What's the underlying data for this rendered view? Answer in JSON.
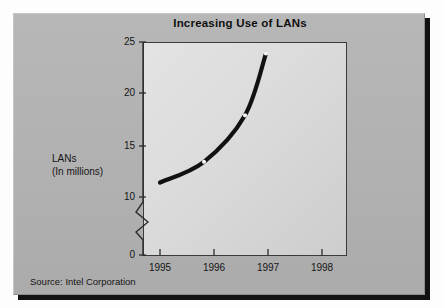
{
  "chart_data": {
    "type": "line",
    "title": "Increasing Use of LANs",
    "xlabel": "",
    "ylabel": "LANs (In millions)",
    "ylabel_line1": "LANs",
    "ylabel_line2": "(In millions)",
    "categories": [
      "1995",
      "1996",
      "1997",
      "1998"
    ],
    "values": [
      11.5,
      13.5,
      18,
      24
    ],
    "series": [
      {
        "name": "LANs (In millions)",
        "values": [
          11.5,
          13.5,
          18,
          24
        ]
      }
    ],
    "x_tick_labels": [
      "1995",
      "1996",
      "1997",
      "1998"
    ],
    "y_tick_labels": [
      "0",
      "10",
      "15",
      "20",
      "25"
    ],
    "y_tick_values": [
      0,
      10,
      15,
      20,
      25
    ],
    "ylim": [
      0,
      25
    ],
    "axis_break": true,
    "axis_break_between": [
      0,
      10
    ],
    "grid": false,
    "legend": false,
    "legend_position": "none",
    "line_color": "#111111",
    "marker_color": "#f2f2f2",
    "annotations": [
      "Source: Intel Corporation"
    ]
  },
  "figure": {
    "title": "Increasing Use of LANs",
    "source_note": "Source: Intel Corporation",
    "panel_color": "#b3b3b3",
    "plot_background": "#d9d9d9",
    "accent_color": "#111111"
  },
  "axes": {
    "y_title_line1": "LANs",
    "y_title_line2": "(In millions)",
    "y_ticks": [
      {
        "label": "25",
        "value": 25
      },
      {
        "label": "20",
        "value": 20
      },
      {
        "label": "15",
        "value": 15
      },
      {
        "label": "10",
        "value": 10
      },
      {
        "label": "0",
        "value": 0
      }
    ],
    "x_ticks": [
      {
        "label": "1995",
        "value": 1995
      },
      {
        "label": "1996",
        "value": 1996
      },
      {
        "label": "1997",
        "value": 1997
      },
      {
        "label": "1998",
        "value": 1998
      }
    ]
  }
}
